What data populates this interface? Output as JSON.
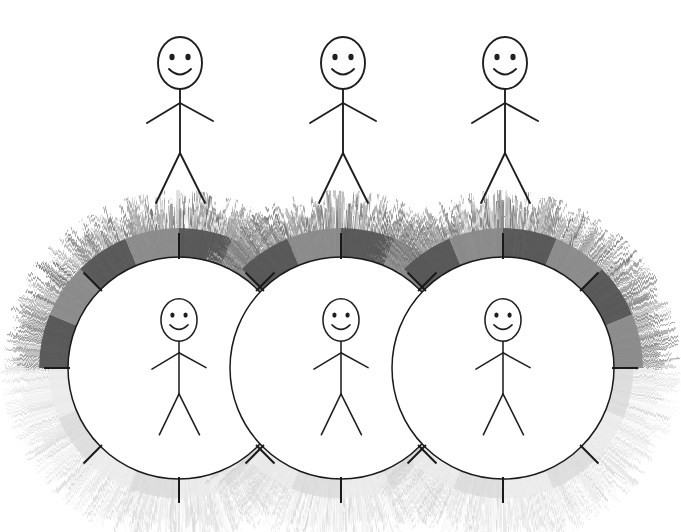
{
  "illustration": {
    "title": "Three stick figures with overlapping haloed circles",
    "canvas": {
      "width": 681,
      "height": 532,
      "background": "#ffffff"
    },
    "palette": {
      "ink": "#1a1a1a",
      "background": "#ffffff",
      "halo_dark": "#555555",
      "halo_medium": "#8a8a8a",
      "halo_light": "#c8c8c8",
      "halo_pale": "#e6e6e6",
      "halo_faint": "#f2f2f2"
    },
    "top_row": {
      "label": "plain stick figures",
      "count": 3,
      "figures": [
        {
          "name": "top-figure-1",
          "cx": 180,
          "head_cy": 63,
          "scale": 1.0
        },
        {
          "name": "top-figure-2",
          "cx": 343,
          "head_cy": 63,
          "scale": 1.0
        },
        {
          "name": "top-figure-3",
          "cx": 505,
          "head_cy": 63,
          "scale": 1.0
        }
      ]
    },
    "bottom_row": {
      "label": "haloed stick figures",
      "count": 3,
      "circle_radius": 111,
      "halo_outer_radius": 178,
      "tick_count": 8,
      "tick_length": 26,
      "figures": [
        {
          "name": "halo-figure-1",
          "cx": 179,
          "cy": 368,
          "head_cy": 320,
          "scale": 0.82
        },
        {
          "name": "halo-figure-2",
          "cx": 341,
          "cy": 368,
          "head_cy": 320,
          "scale": 0.82
        },
        {
          "name": "halo-figure-3",
          "cx": 503,
          "cy": 368,
          "head_cy": 320,
          "scale": 0.82
        }
      ]
    },
    "halo_segments": {
      "description": "alternating gray arc segments in the upper half of each halo ring",
      "upper_tone": "#555555",
      "upper_alt_tone": "#8a8a8a",
      "lower_tone": "#d9d9d9",
      "lower_alt_tone": "#ebebeb"
    },
    "stick_figure_parts": [
      "head",
      "left-eye",
      "right-eye",
      "smile",
      "neck",
      "torso",
      "left-arm",
      "right-arm",
      "left-leg",
      "right-leg"
    ]
  }
}
